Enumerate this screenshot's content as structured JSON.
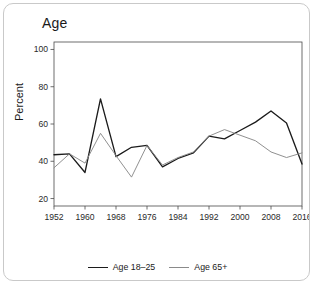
{
  "card": {
    "title": "Age"
  },
  "axis": {
    "ylabel": "Percent",
    "yticks": [
      "20",
      "40",
      "60",
      "80",
      "100"
    ],
    "xticks": [
      "1952",
      "1960",
      "1968",
      "1976",
      "1984",
      "1992",
      "2000",
      "2008",
      "2016"
    ]
  },
  "legend": {
    "items": [
      {
        "label": "Age 18–25",
        "color": "#1c1c1c"
      },
      {
        "label": "Age 65+",
        "color": "#8a8a8a"
      }
    ]
  },
  "chart_data": {
    "type": "line",
    "title": "Age",
    "xlabel": "",
    "ylabel": "Percent",
    "xlim": [
      1952,
      2016
    ],
    "ylim": [
      16,
      104
    ],
    "yticks": [
      20,
      40,
      60,
      80,
      100
    ],
    "xticks": [
      1952,
      1960,
      1968,
      1976,
      1984,
      1992,
      2000,
      2008,
      2016
    ],
    "grid": false,
    "legend_position": "bottom",
    "x": [
      1952,
      1956,
      1960,
      1964,
      1968,
      1972,
      1976,
      1980,
      1984,
      1988,
      1992,
      1996,
      2000,
      2004,
      2008,
      2012,
      2016
    ],
    "series": [
      {
        "name": "Age 18–25",
        "color": "#1c1c1c",
        "values": [
          43.5,
          44,
          34,
          73.5,
          42.5,
          47.5,
          48.5,
          37,
          41.5,
          44.5,
          53.5,
          52,
          56.5,
          61,
          67,
          60.5,
          38.5
        ]
      },
      {
        "name": "Age 65+",
        "color": "#8a8a8a",
        "values": [
          36.5,
          44,
          39,
          55,
          43,
          31.5,
          48.5,
          38,
          42,
          45,
          53.5,
          57,
          54,
          51,
          45,
          42,
          44.5
        ]
      }
    ]
  }
}
